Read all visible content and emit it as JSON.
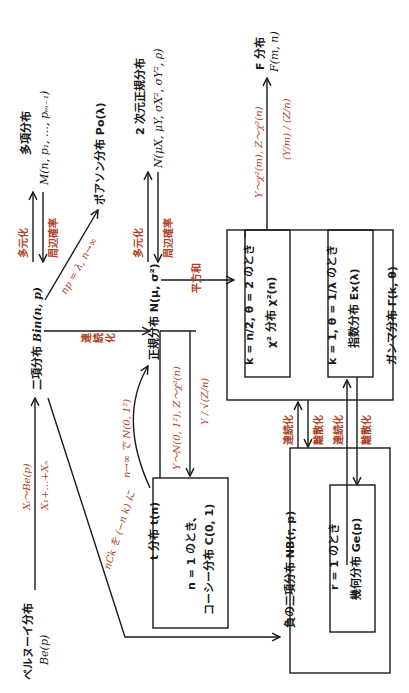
{
  "diagram": {
    "orientation": "rotated-90-ccw",
    "colors": {
      "text": "#1a1a1a",
      "label": "#b0442a",
      "line": "#1a1a1a"
    },
    "nodes": {
      "bernoulli": {
        "name": "ベルヌーイ分布",
        "formula": "Be(p)"
      },
      "binomial": {
        "name": "二項分布",
        "formula": "Bin(n,  p)"
      },
      "multinomial": {
        "name": "多項分布",
        "formula": "M(n,  p₁,  …,  pₘ₋₁)"
      },
      "poisson": {
        "name": "ポアソン分布 Po(λ)"
      },
      "normal": {
        "name": "正規分布 N(μ,  σ²)"
      },
      "bivariate_normal": {
        "name": "2 次元正規分布",
        "formula": "N(μX,  μY,  σX²,  σY²,  ρ)"
      },
      "t_dist": {
        "name": "t 分布 t(n)",
        "cond": "n = 1 のとき、",
        "sub": "コーシー分布 C(0,  1)"
      },
      "chi2": {
        "cond": "k = n/2,  θ = 2 のとき",
        "name": "χ² 分布   χ²(n)"
      },
      "exponential": {
        "cond": "k = 1,  θ = 1/λ のとき",
        "name": "指数分布 Ex(λ)"
      },
      "gamma": {
        "name": "ガンマ分布 Γ(k,  θ)"
      },
      "f_dist": {
        "name": "F 分布",
        "formula": "F(m,  n)"
      },
      "neg_binomial": {
        "name": "負の二項分布 NB(r,  p)"
      },
      "geometric": {
        "cond": "r = 1 のとき",
        "name": "幾何分布 Ge(p)"
      }
    },
    "edge_labels": {
      "bern_to_bin_top": "Xᵢ〜Be(p)",
      "bern_to_bin_bottom": "X₁+…+Xₙ",
      "multi_up": "多元化",
      "multi_down": "周辺確率",
      "poisson_limit": "np = λ,  n→∞",
      "continuous": "連続化",
      "biv_up": "多元化",
      "biv_down": "周辺確率",
      "sum_sq": "平方和",
      "t_limit": "n→∞ で N(0,  1²)",
      "t_cond": "Y〜N(0,  1²),  Z〜χ²(n)",
      "t_ratio": "Y / √(Z/n)",
      "f_cond": "Y〜χ²(m),  Z〜χ²(n)",
      "f_ratio": "(Y/m) / (Z/n)",
      "negbin_label": "nCk を (−n k) に",
      "gamma_nb_1": "連続化",
      "gamma_nb_2": "離散化",
      "exp_geo_1": "連続化",
      "exp_geo_2": "離散化"
    }
  }
}
